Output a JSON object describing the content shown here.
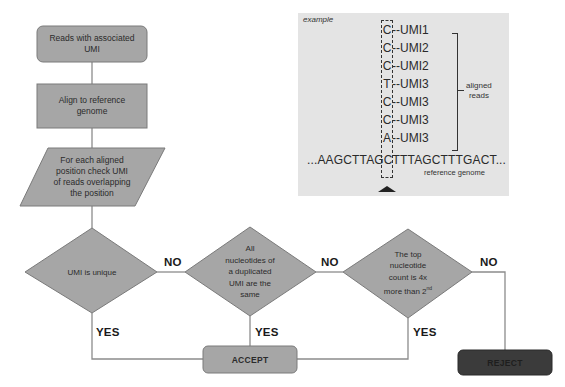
{
  "flowchart": {
    "start": {
      "label": "Reads with associated UMI",
      "lines": [
        "Reads with associated",
        "UMI"
      ]
    },
    "align": {
      "label": "Align to reference genome",
      "lines": [
        "Align to reference",
        "genome"
      ]
    },
    "check": {
      "label": "For each aligned position check UMI of reads overlapping the position",
      "lines": [
        "For each aligned",
        "position check UMI",
        "of reads overlapping",
        "the position"
      ]
    },
    "decision1": {
      "label": "UMI is unique",
      "lines": [
        "UMI is unique"
      ]
    },
    "decision2": {
      "label": "All nucleotides of a duplicated UMI are the same",
      "lines": [
        "All",
        "nucleotides of",
        "a duplicated",
        "UMI are the",
        "same"
      ]
    },
    "decision3": {
      "label": "The top nucleotide count is 4x more than 2nd",
      "lines": [
        "The top",
        "nucleotide",
        "count is 4x",
        "more than 2"
      ],
      "superscript": "nd"
    },
    "accept": {
      "label": "ACCEPT"
    },
    "reject": {
      "label": "REJECT"
    },
    "edge_labels": {
      "d1_no": "NO",
      "d1_yes": "YES",
      "d2_no": "NO",
      "d2_yes": "YES",
      "d3_no": "NO",
      "d3_yes": "YES"
    }
  },
  "example": {
    "title": "example",
    "reads": [
      {
        "nucleotide": "C",
        "umi": "--UMI1"
      },
      {
        "nucleotide": "C",
        "umi": "--UMI2"
      },
      {
        "nucleotide": "C",
        "umi": "--UMI2"
      },
      {
        "nucleotide": "T",
        "umi": "--UMI3"
      },
      {
        "nucleotide": "C",
        "umi": "--UMI3"
      },
      {
        "nucleotide": "C",
        "umi": "--UMI3"
      },
      {
        "nucleotide": "A",
        "umi": "--UMI3"
      }
    ],
    "bracket_label_lines": [
      "aligned",
      "reads"
    ],
    "genome_sequence": "...AAGCTTAGCTTTAGCTTTGACT...",
    "genome_label": "reference genome"
  },
  "colors": {
    "node_fill": "#a6a6a6",
    "node_stroke": "#7a7a7a",
    "connector": "#8c8c8c",
    "reject_fill": "#3b3b3b",
    "reject_text": "#1e1e1e",
    "panel_fill": "#e4e4e4"
  }
}
